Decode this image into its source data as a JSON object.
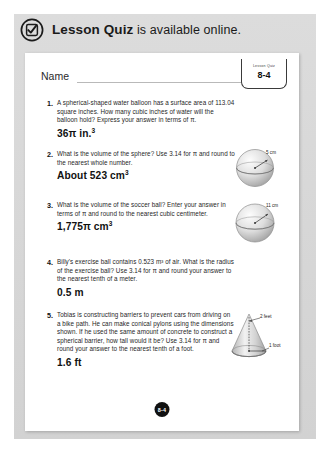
{
  "banner": {
    "icon": "check-circle-icon",
    "bold_text": "Lesson Quiz",
    "rest_text": " is available online."
  },
  "worksheet": {
    "name_label": "Name",
    "badge": {
      "kicker": "Lesson Quiz",
      "number": "8-4"
    },
    "page_number": "8-4",
    "questions": [
      {
        "number": "1.",
        "text": "A spherical-shaped water balloon has a surface area of 113.04 square inches. How many cubic inches of water will the balloon hold? Express your answer in terms of π.",
        "answer": "36π in.",
        "answer_sup": "3",
        "figure": null
      },
      {
        "number": "2.",
        "text": "What is the volume of the sphere? Use 3.14 for π and round to the nearest whole number.",
        "answer": "About 523 cm",
        "answer_sup": "3",
        "figure": {
          "type": "sphere",
          "labels": [
            "5 cm"
          ]
        }
      },
      {
        "number": "3.",
        "text": "What is the volume of the soccer ball? Enter your answer in terms of π and round to the nearest cubic centimeter.",
        "answer": "1,775π cm",
        "answer_sup": "3",
        "figure": {
          "type": "sphere",
          "labels": [
            "11 cm"
          ]
        }
      },
      {
        "number": "4.",
        "text": "Billy's exercise ball contains 0.523 m³ of air. What is the radius of the exercise ball? Use 3.14 for π and round your answer to the nearest tenth of a meter.",
        "answer": "0.5 m",
        "answer_sup": "",
        "figure": null
      },
      {
        "number": "5.",
        "text": "Tobias is constructing barriers to prevent cars from driving on a bike path. He can make conical pylons using the dimensions shown. If he used the same amount of concrete to construct a spherical barrier, how tall would it be? Use 3.14 for π and round your answer to the nearest tenth of a foot.",
        "answer": "1.6 ft",
        "answer_sup": "",
        "figure": {
          "type": "cone",
          "labels": [
            "2 feet",
            "1 foot"
          ]
        }
      }
    ]
  },
  "colors": {
    "panel_grey": "#d9d9d9",
    "sheet_white": "#ffffff",
    "ink": "#1f1f1f",
    "page_dot": "#111111"
  }
}
